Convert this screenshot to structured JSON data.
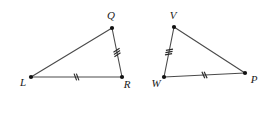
{
  "figure": {
    "background_color": "#ffffff",
    "stroke_color": "#4a4a4a",
    "label_color": "#1a1a1a",
    "width": 272,
    "height": 113
  },
  "triangles": [
    {
      "id": "triangle-LQR",
      "name": "LQR",
      "vertices": [
        {
          "key": "L",
          "label": "L",
          "x": 31,
          "y": 77,
          "label_x": 23,
          "label_y": 83
        },
        {
          "key": "Q",
          "label": "Q",
          "x": 112,
          "y": 28,
          "label_x": 111,
          "label_y": 16
        },
        {
          "key": "R",
          "label": "R",
          "x": 122,
          "y": 77,
          "label_x": 127,
          "label_y": 85
        }
      ],
      "sides": [
        {
          "id": "side-LQ",
          "from": "L",
          "to": "Q",
          "ticks": 0
        },
        {
          "id": "side-QR",
          "from": "Q",
          "to": "R",
          "ticks": 3
        },
        {
          "id": "side-LR",
          "from": "L",
          "to": "R",
          "ticks": 2
        }
      ]
    },
    {
      "id": "triangle-VWP",
      "name": "VWP",
      "vertices": [
        {
          "key": "V",
          "label": "V",
          "x": 174,
          "y": 27,
          "label_x": 173,
          "label_y": 16
        },
        {
          "key": "W",
          "label": "W",
          "x": 164,
          "y": 77,
          "label_x": 156,
          "label_y": 84
        },
        {
          "key": "P",
          "label": "P",
          "x": 245,
          "y": 73,
          "label_x": 254,
          "label_y": 80
        }
      ],
      "sides": [
        {
          "id": "side-VW",
          "from": "V",
          "to": "W",
          "ticks": 3
        },
        {
          "id": "side-VP",
          "from": "V",
          "to": "P",
          "ticks": 0
        },
        {
          "id": "side-WP",
          "from": "W",
          "to": "P",
          "ticks": 2
        }
      ]
    }
  ],
  "tick_legend": {
    "two_ticks_meaning": "congruent pair: LR and WP",
    "three_ticks_meaning": "congruent pair: QR and VW"
  }
}
